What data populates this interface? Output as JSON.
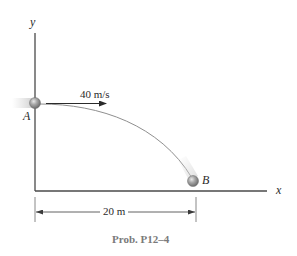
{
  "figure": {
    "caption": "Prob. P12–4",
    "axes": {
      "x_label": "x",
      "y_label": "y"
    },
    "points": {
      "start": {
        "label": "A"
      },
      "end": {
        "label": "B"
      }
    },
    "initial_velocity": {
      "label": "40 m/s",
      "direction": "horizontal-right"
    },
    "horizontal_distance": {
      "label": "20 m"
    },
    "colors": {
      "axis": "#3a3a3a",
      "trajectory": "#8a8a8a",
      "ball": "#9a9a9a",
      "caption": "#7a7a7a",
      "text": "#2a2a2a"
    }
  }
}
